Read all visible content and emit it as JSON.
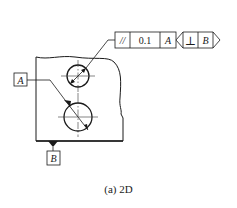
{
  "figure": {
    "caption": "(a) 2D",
    "stroke_color": "#1a1a1a",
    "centerline_color": "#333333"
  },
  "feature_control_frame_1": {
    "symbol": "//",
    "symbol_name": "parallelism",
    "tolerance": "0.1",
    "datum": "A"
  },
  "feature_control_frame_2": {
    "symbol": "⊥",
    "symbol_name": "perpendicularity",
    "datum": "B"
  },
  "datum_labels": {
    "a": "A",
    "b": "B"
  },
  "part": {
    "holes": [
      {
        "name": "upper-hole",
        "cx": 78,
        "cy": 76,
        "r": 11
      },
      {
        "name": "lower-hole",
        "cx": 78,
        "cy": 117,
        "r": 14
      }
    ]
  }
}
